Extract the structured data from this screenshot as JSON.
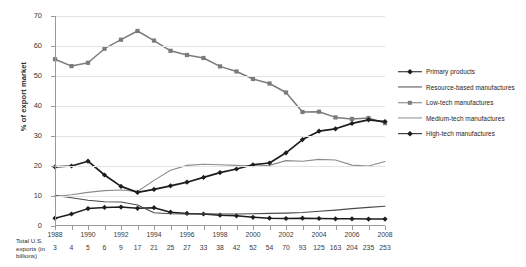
{
  "chart_data": {
    "type": "line",
    "title": "",
    "xlabel": "",
    "ylabel": "% of export market",
    "ylim": [
      0,
      70
    ],
    "ytick_step": 10,
    "yticks": [
      "0",
      "10",
      "20",
      "30",
      "40",
      "50",
      "60",
      "70"
    ],
    "grid": true,
    "legend_position": "right",
    "x": [
      1988,
      1989,
      1990,
      1991,
      1992,
      1993,
      1994,
      1995,
      1996,
      1997,
      1998,
      1999,
      2000,
      2001,
      2002,
      2003,
      2004,
      2005,
      2006,
      2007,
      2008
    ],
    "xtick_labels": [
      "1988",
      "1990",
      "1992",
      "1994",
      "1996",
      "1998",
      "2000",
      "2002",
      "2004",
      "2006",
      "2008"
    ],
    "secondary_axis_label": "Total U.S. exports (in billions)",
    "secondary_axis_values": [
      "3",
      "4",
      "5",
      "6",
      "9",
      "17",
      "21",
      "25",
      "27",
      "33",
      "38",
      "42",
      "52",
      "54",
      "70",
      "93",
      "125",
      "163",
      "204",
      "235",
      "253"
    ],
    "series": [
      {
        "name": "Primary products",
        "color": "#1d1d1d",
        "marker": "diamond",
        "width": 1.5,
        "values": [
          2.6,
          4.0,
          5.8,
          6.2,
          6.3,
          5.9,
          6.1,
          4.6,
          4.2,
          4.0,
          3.6,
          3.4,
          2.9,
          2.6,
          2.5,
          2.6,
          2.5,
          2.4,
          2.4,
          2.3,
          2.3
        ]
      },
      {
        "name": "Resource-based manufactures",
        "color": "#4a4a4a",
        "marker": "none",
        "width": 1.1,
        "values": [
          10.2,
          9.4,
          8.6,
          8.1,
          8.0,
          7.0,
          4.4,
          4.1,
          4.0,
          4.1,
          4.0,
          4.0,
          4.1,
          4.2,
          4.3,
          4.5,
          4.9,
          5.3,
          5.8,
          6.2,
          6.6
        ]
      },
      {
        "name": "Low-tech manufactures",
        "color": "#7b7b7b",
        "marker": "square",
        "width": 1.5,
        "values": [
          55.6,
          53.3,
          54.4,
          59.1,
          62.1,
          65.0,
          61.8,
          58.4,
          57.0,
          56.0,
          53.2,
          51.5,
          49.0,
          47.5,
          44.5,
          38.0,
          38.1,
          36.2,
          35.7,
          36.0,
          34.3
        ]
      },
      {
        "name": "Medium-tech manufactures",
        "color": "#8c8c8c",
        "marker": "none",
        "width": 1.1,
        "values": [
          9.8,
          10.4,
          11.2,
          11.8,
          12.0,
          11.5,
          15.2,
          18.6,
          20.2,
          20.6,
          20.4,
          20.2,
          20.0,
          20.2,
          21.8,
          21.6,
          22.2,
          22.0,
          20.3,
          20.0,
          21.5
        ]
      },
      {
        "name": "High-tech manufactures",
        "color": "#1d1d1d",
        "marker": "diamond",
        "width": 1.7,
        "values": [
          19.7,
          20.0,
          21.6,
          17.0,
          13.2,
          11.2,
          12.2,
          13.4,
          14.6,
          16.2,
          17.8,
          19.0,
          20.4,
          21.0,
          24.4,
          28.8,
          31.6,
          32.4,
          34.2,
          35.4,
          34.8
        ]
      }
    ]
  }
}
